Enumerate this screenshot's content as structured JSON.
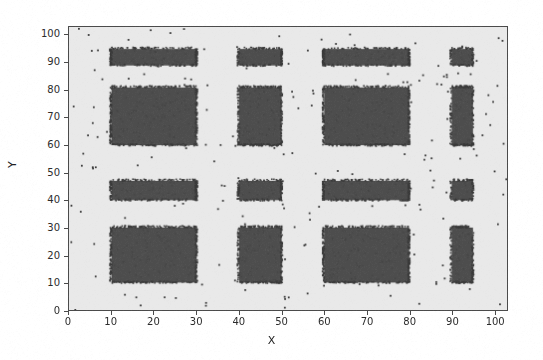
{
  "chart_data": {
    "type": "scatter",
    "title": "",
    "xlabel": "X",
    "ylabel": "Y",
    "xlim": [
      0,
      103
    ],
    "ylim": [
      0,
      103
    ],
    "xticks": [
      0,
      10,
      20,
      30,
      40,
      50,
      60,
      70,
      80,
      90,
      100
    ],
    "yticks": [
      0,
      10,
      20,
      30,
      40,
      50,
      60,
      70,
      80,
      90,
      100
    ],
    "grid": false,
    "legend": null,
    "marker": {
      "shape": "point",
      "color": "#3a3a3a",
      "size_px": 2
    },
    "background_color": "#e9e9e9",
    "axis_color": "#4a4a4a",
    "clusters": [
      {
        "name": "r1c1",
        "x0": 10,
        "x1": 30,
        "y0": 89,
        "y1": 95,
        "density": "high"
      },
      {
        "name": "r1c2",
        "x0": 40,
        "x1": 50,
        "y0": 89,
        "y1": 95,
        "density": "high"
      },
      {
        "name": "r1c3",
        "x0": 60,
        "x1": 80,
        "y0": 89,
        "y1": 95,
        "density": "high"
      },
      {
        "name": "r1c4",
        "x0": 90,
        "x1": 95,
        "y0": 89,
        "y1": 95,
        "density": "high"
      },
      {
        "name": "r2c1",
        "x0": 10,
        "x1": 30,
        "y0": 60,
        "y1": 81,
        "density": "high"
      },
      {
        "name": "r2c2",
        "x0": 40,
        "x1": 50,
        "y0": 60,
        "y1": 81,
        "density": "high"
      },
      {
        "name": "r2c3",
        "x0": 60,
        "x1": 80,
        "y0": 60,
        "y1": 81,
        "density": "high"
      },
      {
        "name": "r2c4",
        "x0": 90,
        "x1": 95,
        "y0": 60,
        "y1": 81,
        "density": "high"
      },
      {
        "name": "r3c1",
        "x0": 10,
        "x1": 30,
        "y0": 40,
        "y1": 47,
        "density": "high"
      },
      {
        "name": "r3c2",
        "x0": 40,
        "x1": 50,
        "y0": 40,
        "y1": 47,
        "density": "high"
      },
      {
        "name": "r3c3",
        "x0": 60,
        "x1": 80,
        "y0": 40,
        "y1": 47,
        "density": "high"
      },
      {
        "name": "r3c4",
        "x0": 90,
        "x1": 95,
        "y0": 40,
        "y1": 47,
        "density": "high"
      },
      {
        "name": "r4c1",
        "x0": 10,
        "x1": 30,
        "y0": 10,
        "y1": 30,
        "density": "high"
      },
      {
        "name": "r4c2",
        "x0": 40,
        "x1": 50,
        "y0": 10,
        "y1": 30,
        "density": "high"
      },
      {
        "name": "r4c3",
        "x0": 60,
        "x1": 80,
        "y0": 10,
        "y1": 30,
        "density": "high"
      },
      {
        "name": "r4c4",
        "x0": 90,
        "x1": 95,
        "y0": 10,
        "y1": 30,
        "density": "high"
      }
    ],
    "background_noise": {
      "count": 250,
      "x_range": [
        0,
        103
      ],
      "y_range": [
        0,
        103
      ],
      "distribution": "uniform"
    }
  },
  "axis": {
    "xlabel": "X",
    "ylabel": "Y",
    "xticklabels": [
      "0",
      "10",
      "20",
      "30",
      "40",
      "50",
      "60",
      "70",
      "80",
      "90",
      "100"
    ],
    "yticklabels": [
      "0",
      "10",
      "20",
      "30",
      "40",
      "50",
      "60",
      "70",
      "80",
      "90",
      "100"
    ]
  }
}
